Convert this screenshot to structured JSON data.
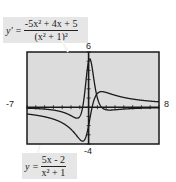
{
  "labels": {
    "y_max": "6",
    "y_min": "-4",
    "x_min": "-7",
    "x_max": "8"
  },
  "equations": {
    "derivative": {
      "lhs": "y' =",
      "numerator": "-5x² + 4x + 5",
      "denominator": "(x² + 1)²"
    },
    "function": {
      "lhs": "y =",
      "numerator": "5x - 2",
      "denominator": "x² + 1"
    }
  },
  "colors": {
    "screen_bg": "#dcdcdc",
    "frame": "#1a1a1a",
    "curve": "#1a1a1a",
    "label_box": "#e6e6e6"
  },
  "chart_data": {
    "type": "line",
    "title": "",
    "xlabel": "",
    "ylabel": "",
    "xlim": [
      -7,
      8
    ],
    "ylim": [
      -4,
      6
    ],
    "grid": false,
    "legend_position": "callout labels (top-left for y', bottom-left for y)",
    "series": [
      {
        "name": "y = (5x - 2)/(x^2 + 1)",
        "formula": "(5x-2)/(x^2+1)",
        "x": [
          -7,
          -5,
          -3,
          -2,
          -1,
          -0.4,
          0,
          0.4,
          1,
          2,
          3,
          5,
          8
        ],
        "values": [
          -0.74,
          -1.04,
          -1.7,
          -2.4,
          -3.5,
          -3.45,
          -2.0,
          0.0,
          1.5,
          1.6,
          1.3,
          0.88,
          0.58
        ]
      },
      {
        "name": "y' = (-5x^2 + 4x + 5)/(x^2 + 1)^2",
        "formula": "(-5x^2+4x+5)/(x^2+1)^2",
        "x": [
          -7,
          -5,
          -3,
          -2,
          -1,
          -0.5,
          0,
          0.2,
          0.5,
          1,
          2,
          3,
          5,
          8
        ],
        "values": [
          -0.1,
          -0.2,
          -0.52,
          -0.92,
          -1.0,
          2.24,
          5.0,
          5.45,
          4.16,
          1.0,
          -0.28,
          -0.32,
          -0.17,
          -0.08
        ]
      }
    ]
  }
}
